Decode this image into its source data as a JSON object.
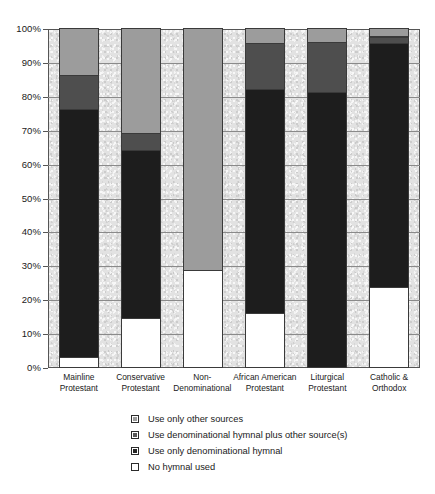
{
  "chart_data": {
    "type": "bar",
    "subtype": "stacked-bar-100-percent",
    "title": "",
    "subtitle": "",
    "xlabel": "",
    "ylabel": "",
    "ylim": [
      0,
      100
    ],
    "yunit": "%",
    "grid": true,
    "legend_position": "bottom-center",
    "categories": [
      "Mainline Protestant",
      "Conservative Protestant",
      "Non-Denominational",
      "African American Protestant",
      "Liturgical Protestant",
      "Catholic & Orthodox"
    ],
    "category_lines": [
      [
        "Mainline",
        "Protestant"
      ],
      [
        "Conservative",
        "Protestant"
      ],
      [
        "Non-",
        "Denominational"
      ],
      [
        "African American",
        "Protestant"
      ],
      [
        "Liturgical",
        "Protestant"
      ],
      [
        "Catholic &",
        "Orthodox"
      ]
    ],
    "ticks": [
      {
        "value": 100,
        "label": "100%"
      },
      {
        "value": 90,
        "label": "90%"
      },
      {
        "value": 80,
        "label": "80%"
      },
      {
        "value": 70,
        "label": "70%"
      },
      {
        "value": 60,
        "label": "60%"
      },
      {
        "value": 50,
        "label": "50%"
      },
      {
        "value": 40,
        "label": "40%"
      },
      {
        "value": 30,
        "label": "30%"
      },
      {
        "value": 20,
        "label": "20%"
      },
      {
        "value": 10,
        "label": "10%"
      },
      {
        "value": 0,
        "label": "0%"
      }
    ],
    "stack_order_bottom_to_top": [
      "none",
      "denom",
      "plus",
      "other"
    ],
    "series": [
      {
        "key": "none",
        "name": "No hymnal used",
        "color": "#ffffff",
        "values": [
          3.0,
          14.5,
          28.5,
          16.0,
          0.0,
          23.5
        ]
      },
      {
        "key": "denom",
        "name": "Use only denominational hymnal",
        "color": "#1d1d1d",
        "values": [
          73.0,
          49.5,
          0.0,
          66.0,
          81.0,
          72.0
        ]
      },
      {
        "key": "plus",
        "name": "Use denominational hymnal plus other source(s)",
        "color": "#4e4e4e",
        "values": [
          10.0,
          5.0,
          0.0,
          13.5,
          15.0,
          2.0
        ]
      },
      {
        "key": "other",
        "name": "Use only other sources",
        "color": "#9c9c9c",
        "values": [
          14.0,
          31.0,
          71.5,
          4.5,
          4.0,
          2.5
        ]
      }
    ],
    "cumulative_tops": {
      "Mainline Protestant": {
        "none": 3.0,
        "denom": 76.0,
        "plus": 86.0,
        "other": 100.0
      },
      "Conservative Protestant": {
        "none": 14.5,
        "denom": 64.0,
        "plus": 69.0,
        "other": 100.0
      },
      "Non-Denominational": {
        "none": 28.5,
        "denom": 28.5,
        "plus": 28.5,
        "other": 100.0
      },
      "African American Protestant": {
        "none": 16.0,
        "denom": 82.0,
        "plus": 95.5,
        "other": 100.0
      },
      "Liturgical Protestant": {
        "none": 0.0,
        "denom": 81.0,
        "plus": 96.0,
        "other": 100.0
      },
      "Catholic & Orthodox": {
        "none": 23.5,
        "denom": 95.5,
        "plus": 97.5,
        "other": 100.0
      }
    },
    "legend": [
      {
        "key": "other",
        "label": "Use only other sources",
        "color": "#9c9c9c"
      },
      {
        "key": "plus",
        "label": "Use denominational hymnal plus other source(s)",
        "color": "#585858"
      },
      {
        "key": "denom",
        "label": "Use only denominational hymnal",
        "color": "#262626"
      },
      {
        "key": "none",
        "label": "No hymnal used",
        "color": "#ffffff"
      }
    ]
  }
}
